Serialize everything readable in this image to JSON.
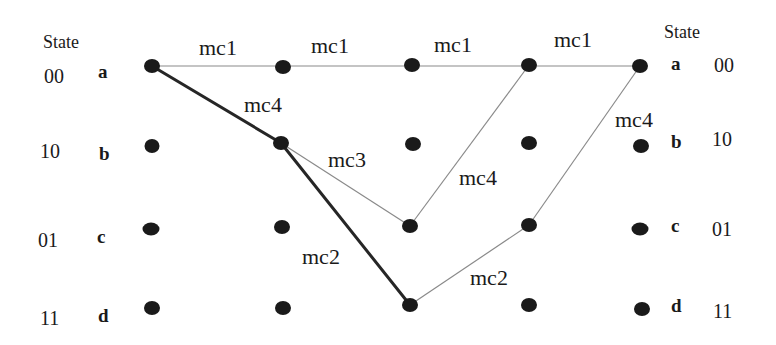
{
  "diagram": {
    "type": "trellis",
    "left_header": "State",
    "right_header": "State",
    "states": [
      {
        "letter": "a",
        "code": "00"
      },
      {
        "letter": "b",
        "code": "10"
      },
      {
        "letter": "c",
        "code": "01"
      },
      {
        "letter": "d",
        "code": "11"
      }
    ],
    "edge_labels": {
      "a0_a1": "mc1",
      "a1_a2": "mc1",
      "a2_a3": "mc1",
      "a3_a4": "mc1",
      "a0_b1": "mc4",
      "b1_c2": "mc3",
      "b1_d2": "mc2",
      "c2_a3": "mc4",
      "d2_c3": "mc2",
      "c3_a4": "mc4"
    },
    "colors": {
      "node": "#1a1a1a",
      "thick_edge": "#262626",
      "thin_edge": "#8a8a8a",
      "text": "#1a1a1a"
    }
  }
}
